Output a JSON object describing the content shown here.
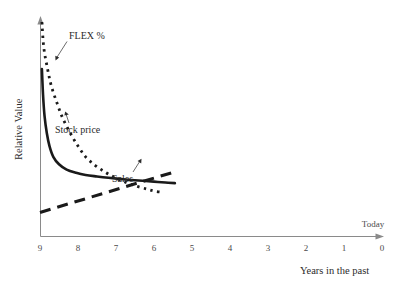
{
  "chart_data": {
    "type": "line",
    "title": "",
    "xlabel": "Years in the past",
    "ylabel": "Relative Value",
    "xlim": [
      9,
      0
    ],
    "ylim": [
      0,
      100
    ],
    "x_ticks": [
      "9",
      "8",
      "7",
      "6",
      "5",
      "4",
      "3",
      "2",
      "1",
      "0"
    ],
    "y_ticks": [],
    "grid": false,
    "legend": "inline-annotations",
    "annotations": [
      {
        "text": "Today",
        "target": "x-axis-right-end"
      }
    ],
    "series": [
      {
        "name": "FLEX %",
        "style": "dotted",
        "x": [
          8.95,
          8.9,
          8.8,
          8.7,
          8.55,
          8.4,
          8.2,
          8.0,
          7.8,
          7.55,
          7.3,
          7.05,
          6.8,
          6.5,
          6.2,
          6.0,
          5.8
        ],
        "values": [
          100,
          88,
          78,
          70,
          62,
          55,
          48,
          42,
          37,
          33,
          30,
          27.5,
          25.5,
          23.5,
          22,
          21,
          20.5
        ]
      },
      {
        "name": "Stock price",
        "style": "solid",
        "x": [
          8.95,
          8.92,
          8.88,
          8.82,
          8.75,
          8.65,
          8.5,
          8.3,
          8.05,
          7.8,
          7.5,
          7.2,
          6.9,
          6.6,
          6.3,
          6.0,
          5.7,
          5.45
        ],
        "values": [
          78,
          66,
          56,
          48,
          42,
          37,
          33.5,
          31,
          29.5,
          28.5,
          27.8,
          27.2,
          26.7,
          26.2,
          25.8,
          25.4,
          25.0,
          24.7
        ]
      },
      {
        "name": "Sales",
        "style": "dashed",
        "x": [
          9.0,
          5.45
        ],
        "values": [
          11,
          30
        ]
      }
    ]
  },
  "labels": {
    "flex": "FLEX %",
    "stock_price": "Stock price",
    "sales": "Sales",
    "today": "Today",
    "y_axis_title": "Relative Value",
    "x_axis_title": "Years in the past"
  },
  "ticks": {
    "t0": "9",
    "t1": "8",
    "t2": "7",
    "t3": "6",
    "t4": "5",
    "t5": "4",
    "t6": "3",
    "t7": "2",
    "t8": "1",
    "t9": "0"
  },
  "colors": {
    "ink": "#1a1a1a",
    "axis": "#8a8a8a",
    "text": "#2b2b2b",
    "tick_text": "#4a4a4a",
    "background": "#ffffff"
  }
}
